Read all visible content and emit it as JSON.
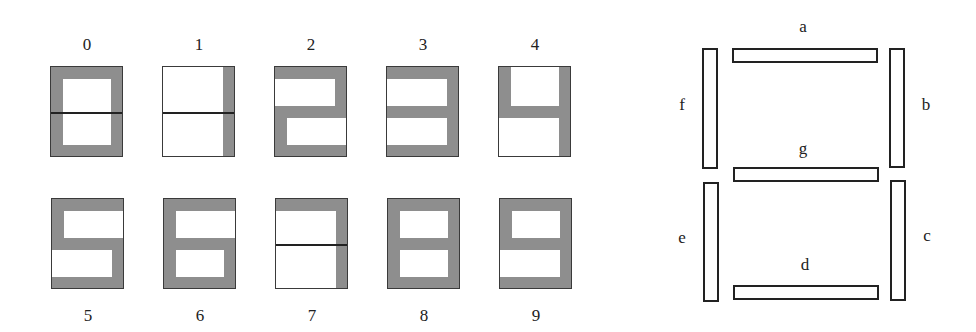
{
  "digits": [
    {
      "label": "0",
      "segments": [
        "a",
        "b",
        "c",
        "d",
        "e",
        "f"
      ],
      "divider": true
    },
    {
      "label": "1",
      "segments": [
        "b",
        "c"
      ],
      "divider": true
    },
    {
      "label": "2",
      "segments": [
        "a",
        "b",
        "g",
        "e",
        "d"
      ],
      "divider": false
    },
    {
      "label": "3",
      "segments": [
        "a",
        "b",
        "g",
        "c",
        "d"
      ],
      "divider": false
    },
    {
      "label": "4",
      "segments": [
        "f",
        "g",
        "b",
        "c"
      ],
      "divider": false
    },
    {
      "label": "5",
      "segments": [
        "a",
        "f",
        "g",
        "c",
        "d"
      ],
      "divider": false
    },
    {
      "label": "6",
      "segments": [
        "a",
        "f",
        "g",
        "e",
        "c",
        "d"
      ],
      "divider": false
    },
    {
      "label": "7",
      "segments": [
        "a",
        "b",
        "c"
      ],
      "divider": true
    },
    {
      "label": "8",
      "segments": [
        "a",
        "b",
        "c",
        "d",
        "e",
        "f",
        "g"
      ],
      "divider": false
    },
    {
      "label": "9",
      "segments": [
        "a",
        "b",
        "c",
        "d",
        "f",
        "g"
      ],
      "divider": false
    }
  ],
  "segment_key": {
    "labels": {
      "a": "a",
      "b": "b",
      "c": "c",
      "d": "d",
      "e": "e",
      "f": "f",
      "g": "g"
    }
  },
  "colors": {
    "lit_segment": "#8e8e8e",
    "outline": "#222222"
  }
}
